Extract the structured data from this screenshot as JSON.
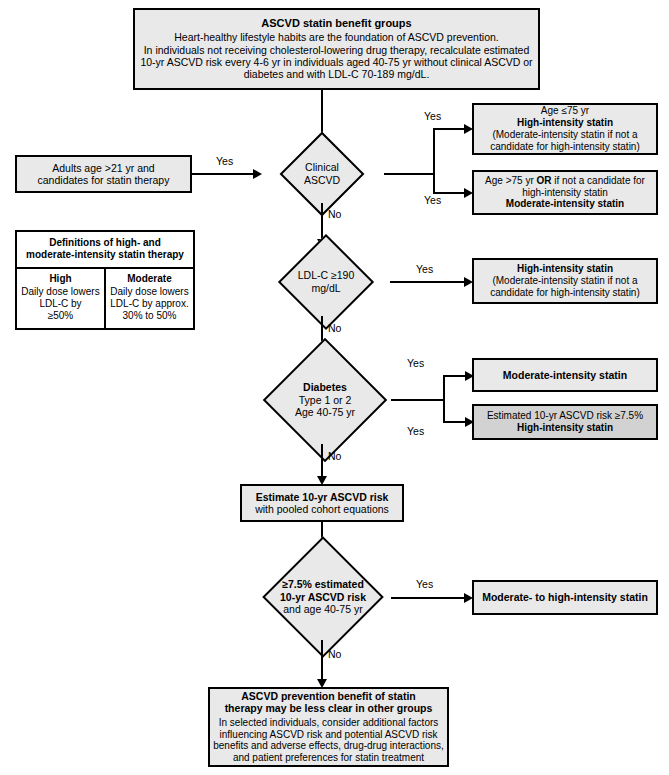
{
  "colors": {
    "node_fill": "#e9e9e9",
    "node_fill_dark": "#d2d2d2",
    "node_fill_white": "#ffffff",
    "stroke": "#000000",
    "background": "#ffffff"
  },
  "header": {
    "title": "ASCVD statin benefit groups",
    "line1": "Heart-healthy lifestyle habits are the foundation of ASCVD prevention.",
    "line2": "In individuals not receiving cholesterol-lowering drug therapy, recalculate estimated",
    "line3": "10-yr ASCVD risk every 4-6 yr in individuals aged 40-75 yr without clinical ASCVD or",
    "line4": "diabetes and with LDL-C 70-189 mg/dL."
  },
  "start": {
    "line1": "Adults age >21 yr and",
    "line2": "candidates for statin therapy"
  },
  "definitions": {
    "header_line1": "Definitions of high- and",
    "header_line2": "moderate-intensity statin therapy",
    "columns": [
      {
        "heading": "High",
        "line1": "Daily dose lowers",
        "line2": "LDL-C by",
        "line3": "≥50%"
      },
      {
        "heading": "Moderate",
        "line1": "Daily dose lowers",
        "line2": "LDL-C by approx.",
        "line3": "30% to 50%"
      }
    ]
  },
  "decisions": {
    "clinical_ascvd": {
      "line1": "Clinical",
      "line2": "ASCVD"
    },
    "ldl_c": {
      "line1": "LDL-C ≥190",
      "line2": "mg/dL"
    },
    "diabetes": {
      "line1": "Diabetes",
      "line2": "Type 1 or 2",
      "line3": "Age 40-75 yr"
    },
    "risk_threshold": {
      "line1": "≥7.5% estimated",
      "line2": "10-yr ASCVD risk",
      "line3": "and age 40-75 yr"
    }
  },
  "outcomes": {
    "ascvd_le75": {
      "line1": "Age ≤75 yr",
      "line2": "High-intensity statin",
      "line3": "(Moderate-intensity statin if not a",
      "line4": "candidate for high-intensity statin)"
    },
    "ascvd_gt75": {
      "line1_a": "Age >75 yr ",
      "line1_b": "OR",
      "line1_c": " if not a candidate for",
      "line2": "high-intensity statin",
      "line3": "Moderate-intensity statin"
    },
    "ldl_high": {
      "line1": "High-intensity statin",
      "line2": "(Moderate-intensity statin if not a",
      "line3": "candidate for high-intensity statin)"
    },
    "diabetes_moderate": {
      "line1": "Moderate-intensity statin"
    },
    "diabetes_high": {
      "line1": "Estimated 10-yr ASCVD risk ≥7.5%",
      "line2": "High-intensity statin"
    },
    "risk_outcome": {
      "line1": "Moderate- to high-intensity statin"
    }
  },
  "estimate_box": {
    "line1": "Estimate 10-yr ASCVD risk",
    "line2": "with pooled cohort equations"
  },
  "footer": {
    "title_line1": "ASCVD prevention benefit of statin",
    "title_line2": "therapy may be less clear in other groups",
    "line1": "In selected individuals, consider additional factors",
    "line2": "influencing ASCVD risk and potential ASCVD risk",
    "line3": "benefits and adverse effects, drug-drug interactions,",
    "line4": "and patient preferences for statin treatment"
  },
  "edge_labels": {
    "start_yes": "Yes",
    "ascvd_yes_1": "Yes",
    "ascvd_yes_2": "Yes",
    "ascvd_no": "No",
    "ldl_yes": "Yes",
    "ldl_no": "No",
    "diabetes_yes_1": "Yes",
    "diabetes_yes_2": "Yes",
    "diabetes_no": "No",
    "risk_yes": "Yes",
    "risk_no": "No"
  }
}
